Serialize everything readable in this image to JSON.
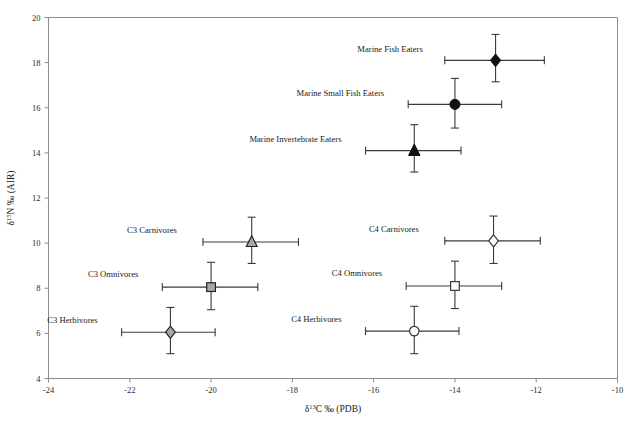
{
  "chart_data": {
    "type": "scatter",
    "title": "",
    "xlabel": "δ¹³C ‰ (PDB)",
    "ylabel": "δ¹⁵N ‰ (AIR)",
    "xlim": [
      -24,
      -10
    ],
    "ylim": [
      4,
      20
    ],
    "xticks": [
      -24,
      -22,
      -20,
      -18,
      -16,
      -14,
      -12,
      -10
    ],
    "xtick_labels": [
      "-24",
      "-22",
      "-20",
      "-18",
      "-16",
      "-14",
      "-12",
      "-10"
    ],
    "yticks": [
      4,
      6,
      8,
      10,
      12,
      14,
      16,
      18,
      20
    ],
    "ytick_labels": [
      "4",
      "6",
      "8",
      "10",
      "12",
      "14",
      "16",
      "18",
      "20"
    ],
    "grid": false,
    "legend": "none",
    "legend_position": "inline-labels",
    "points": [
      {
        "label": "Marine Fish Eaters",
        "x": -13.0,
        "y": 18.1,
        "xerr_low": -14.25,
        "xerr_high": -11.8,
        "yerr_low": 17.15,
        "yerr_high": 19.25,
        "marker": "diamond",
        "fill": "filled",
        "label_anchor": "end",
        "label_dx": -22,
        "label_dy": -8
      },
      {
        "label": "Marine Small Fish Eaters",
        "x": -14.0,
        "y": 16.15,
        "xerr_low": -15.15,
        "xerr_high": -12.85,
        "yerr_low": 15.1,
        "yerr_high": 17.3,
        "marker": "circle",
        "fill": "filled",
        "label_anchor": "end",
        "label_dx": -24,
        "label_dy": -8
      },
      {
        "label": "Marine Invertebrate Eaters",
        "x": -15.0,
        "y": 14.1,
        "xerr_low": -16.2,
        "xerr_high": -13.85,
        "yerr_low": 13.15,
        "yerr_high": 15.25,
        "marker": "triangle",
        "fill": "filled",
        "label_anchor": "end",
        "label_dx": -24,
        "label_dy": -9
      },
      {
        "label": "C3 Carnivores",
        "x": -19.0,
        "y": 10.05,
        "xerr_low": -20.2,
        "xerr_high": -17.85,
        "yerr_low": 9.1,
        "yerr_high": 11.15,
        "marker": "triangle",
        "fill": "gray",
        "label_anchor": "end",
        "label_dx": -26,
        "label_dy": -9
      },
      {
        "label": "C3 Omnivores",
        "x": -20.0,
        "y": 8.05,
        "xerr_low": -21.2,
        "xerr_high": -18.85,
        "yerr_low": 7.05,
        "yerr_high": 9.15,
        "marker": "square",
        "fill": "gray",
        "label_anchor": "end",
        "label_dx": -24,
        "label_dy": -10
      },
      {
        "label": "C3 Herbivores",
        "x": -21.0,
        "y": 6.05,
        "xerr_low": -22.2,
        "xerr_high": -19.9,
        "yerr_low": 5.1,
        "yerr_high": 7.15,
        "marker": "diamond",
        "fill": "gray",
        "label_anchor": "end",
        "label_dx": -24,
        "label_dy": -9
      },
      {
        "label": "C4 Carnivores",
        "x": -13.05,
        "y": 10.1,
        "xerr_low": -14.25,
        "xerr_high": -11.9,
        "yerr_low": 9.1,
        "yerr_high": 11.2,
        "marker": "diamond",
        "fill": "open",
        "label_anchor": "end",
        "label_dx": -26,
        "label_dy": -9
      },
      {
        "label": "C4 Omnivores",
        "x": -14.0,
        "y": 8.1,
        "xerr_low": -15.2,
        "xerr_high": -12.85,
        "yerr_low": 7.1,
        "yerr_high": 9.2,
        "marker": "square",
        "fill": "open",
        "label_anchor": "end",
        "label_dx": -24,
        "label_dy": -10
      },
      {
        "label": "C4 Herbivores",
        "x": -15.0,
        "y": 6.1,
        "xerr_low": -16.2,
        "xerr_high": -13.9,
        "yerr_low": 5.1,
        "yerr_high": 7.2,
        "marker": "circle",
        "fill": "open",
        "label_anchor": "end",
        "label_dx": -24,
        "label_dy": -9
      }
    ]
  },
  "style": {
    "axis_color": "#8c8c8c",
    "marker_filled_color": "#111111",
    "marker_gray_color": "#a8a8a8",
    "marker_open_color": "#ffffff",
    "error_bar_color": "#3a3a3a",
    "background": "#ffffff"
  }
}
